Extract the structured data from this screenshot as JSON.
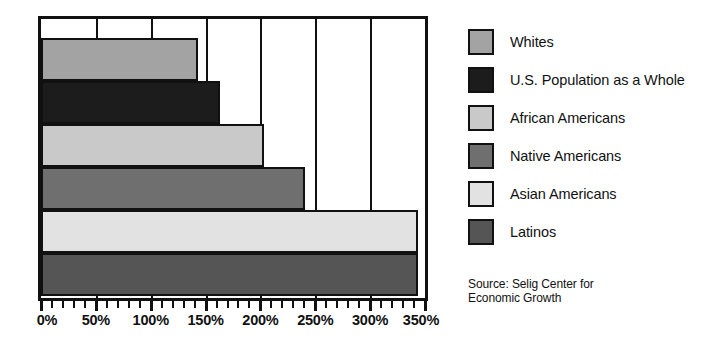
{
  "chart_data": {
    "type": "bar",
    "orientation": "horizontal",
    "title": "",
    "xlabel": "",
    "ylabel": "",
    "xlim": [
      0,
      350
    ],
    "xtick_labels": [
      "0%",
      "50%",
      "100%",
      "150%",
      "200%",
      "250%",
      "300%",
      "350%"
    ],
    "xtick_values": [
      0,
      50,
      100,
      150,
      200,
      250,
      300,
      350
    ],
    "minor_tick_step": 10,
    "grid": true,
    "grid_axis": "x",
    "legend_position": "right",
    "categories": [
      "Whites",
      "U.S. Population as a Whole",
      "African Americans",
      "Native Americans",
      "Asian Americans",
      "Latinos"
    ],
    "values": [
      143,
      163,
      203,
      241,
      344,
      344
    ],
    "colors": [
      "#a3a3a3",
      "#1c1c1c",
      "#c9c9c9",
      "#6f6f6f",
      "#e2e2e2",
      "#555555"
    ],
    "annotations": [
      "Source: Selig Center for Economic Growth"
    ]
  },
  "legend": {
    "items": [
      {
        "label": "Whites",
        "color": "#a3a3a3"
      },
      {
        "label": "U.S. Population as a Whole",
        "color": "#1c1c1c"
      },
      {
        "label": "African Americans",
        "color": "#c9c9c9"
      },
      {
        "label": "Native Americans",
        "color": "#6f6f6f"
      },
      {
        "label": "Asian Americans",
        "color": "#e2e2e2"
      },
      {
        "label": "Latinos",
        "color": "#555555"
      }
    ]
  },
  "source": {
    "line1": "Source: Selig Center for",
    "line2": "Economic Growth"
  },
  "axis": {
    "labels": [
      "0%",
      "50%",
      "100%",
      "150%",
      "200%",
      "250%",
      "300%",
      "350%"
    ]
  },
  "style": {
    "frame_color": "#111111",
    "background": "#ffffff"
  }
}
